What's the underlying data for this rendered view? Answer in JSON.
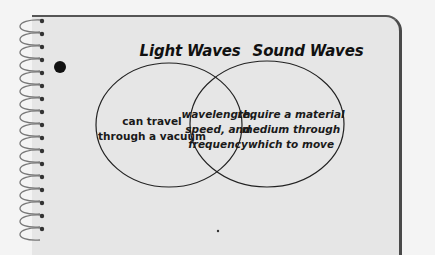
{
  "diagram": {
    "type": "venn",
    "sets": [
      {
        "title": "Light Waves",
        "unique": [
          "can travel",
          "through a vacuum"
        ]
      },
      {
        "title": "Sound Waves",
        "unique": [
          "require a material",
          "medium through",
          "which to move"
        ]
      }
    ],
    "intersection": [
      "wavelength,",
      "speed, and",
      "frequency"
    ]
  },
  "colors": {
    "paper": "#e6e6e6",
    "background": "#f4f4f4",
    "ink": "#111111",
    "border": "#4a4a4a"
  }
}
